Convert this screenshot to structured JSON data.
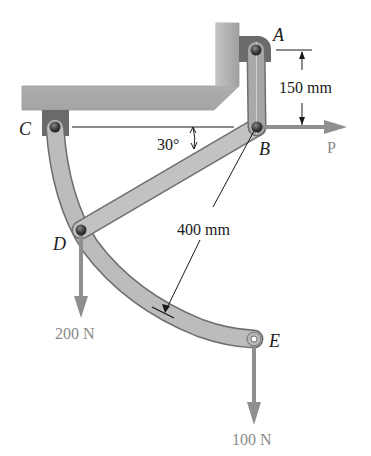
{
  "figure": {
    "type": "mechanism",
    "points": {
      "A": "A",
      "B": "B",
      "C": "C",
      "D": "D",
      "E": "E"
    },
    "dimensions": {
      "ab_length": "150 mm",
      "arc_radius": "400 mm",
      "angle": "30°"
    },
    "forces": {
      "p_label": "P",
      "d_load": "200 N",
      "e_load": "100 N"
    },
    "colors": {
      "member": "#b9b9b9",
      "member_edge": "#6e6e6e",
      "frame": "#b3b3b3",
      "bracket": "#6a6a6a",
      "pin": "#3a3a3a",
      "force_arrow": "#8f8f8f",
      "dim_line": "#1a1a1a"
    }
  }
}
